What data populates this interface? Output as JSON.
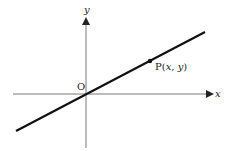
{
  "diagram": {
    "axes": {
      "x_label": "x",
      "y_label": "y",
      "origin_label": "O"
    },
    "point": {
      "name": "P",
      "open": "(",
      "x": "x",
      "comma": ", ",
      "y": "y",
      "close": ")"
    },
    "colors": {
      "ink": "#222222",
      "background": "#ffffff"
    }
  }
}
